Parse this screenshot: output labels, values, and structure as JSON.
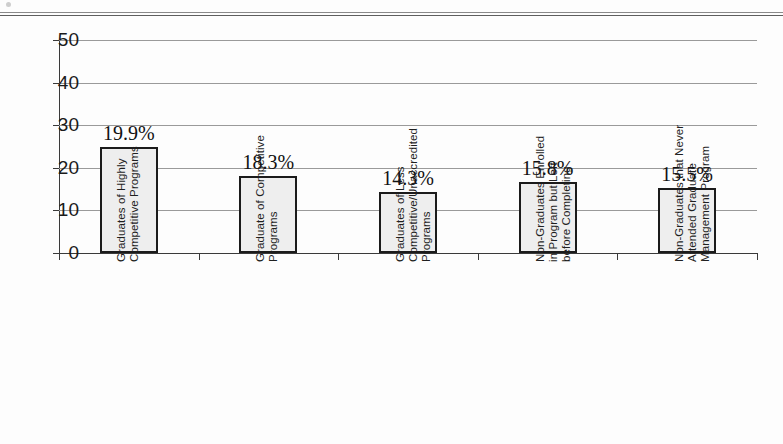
{
  "page": {
    "top_rule": "horizontal-rule"
  },
  "chart_data": {
    "type": "bar",
    "title": "",
    "subtitle": "",
    "xlabel": "",
    "ylabel": "",
    "ylim": [
      0,
      50
    ],
    "yticks": [
      0,
      10,
      20,
      30,
      40,
      50
    ],
    "grid": true,
    "legend": false,
    "categories": [
      "Graduates of Highly Competitive Programs",
      "Graduate of Competitive Programs",
      "Graduates of Less Competitive/Unaccredited Programs",
      "Non-Graduates Enrolled in Program but Left before Completing",
      "Non-Graduates that Never Attended Graduate Management Program"
    ],
    "category_lines": [
      [
        "Graduates of Highly",
        "Competitive Programs"
      ],
      [
        "Graduate of Competitive",
        "Programs"
      ],
      [
        "Graduates of Less",
        "Competitive/Unaccredited",
        "Programs"
      ],
      [
        "Non-Graduates Enrolled",
        "in Program but Left",
        "before Completing"
      ],
      [
        "Non-Graduates that Never",
        "Attended Graduate",
        "Management Program"
      ]
    ],
    "values": [
      25.0,
      18.1,
      14.3,
      16.6,
      15.3
    ],
    "data_labels": [
      "19.9%",
      "18.3%",
      "14.3%",
      "15.8%",
      "15.5%"
    ],
    "label_values": [
      19.9,
      18.3,
      14.3,
      15.8,
      15.5
    ],
    "colors": {
      "bar_fill": "#eeeeee",
      "bar_pattern": "#8e8e8e",
      "bar_border": "#1b1b1b",
      "gridline": "#9a9a9a",
      "axis": "#3a3a3a",
      "text": "#111111",
      "background": "#fdfdfd"
    }
  },
  "axis": {
    "y_tick_labels": [
      "0",
      "10",
      "20",
      "30",
      "40",
      "50"
    ]
  }
}
